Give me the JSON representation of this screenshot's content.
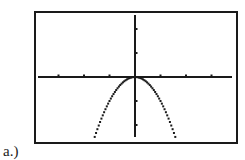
{
  "label": "a.)",
  "colors": {
    "frame": "#1a1a1a",
    "axis": "#1a1a1a",
    "curve": "#1a1a1a",
    "background": "#ffffff"
  },
  "chart_data": {
    "type": "line",
    "title": "",
    "xlabel": "",
    "ylabel": "",
    "function": "y = -x^2",
    "style": "dotted calculator-screen plot",
    "xlim": [
      -3.8,
      3.8
    ],
    "ylim": [
      -2.5,
      2.5
    ],
    "x_ticks": [
      -3,
      -2,
      -1,
      1,
      2,
      3
    ],
    "y_ticks": [
      -2,
      -1,
      1,
      2
    ],
    "tick_labels": false,
    "grid": false,
    "legend": false,
    "x": [
      -1.58,
      -1.4,
      -1.2,
      -1.0,
      -0.8,
      -0.6,
      -0.4,
      -0.2,
      0,
      0.2,
      0.4,
      0.6,
      0.8,
      1.0,
      1.2,
      1.4,
      1.58
    ],
    "y": [
      -2.5,
      -1.96,
      -1.44,
      -1.0,
      -0.64,
      -0.36,
      -0.16,
      -0.04,
      0,
      -0.04,
      -0.16,
      -0.36,
      -0.64,
      -1.0,
      -1.44,
      -1.96,
      -2.5
    ]
  }
}
